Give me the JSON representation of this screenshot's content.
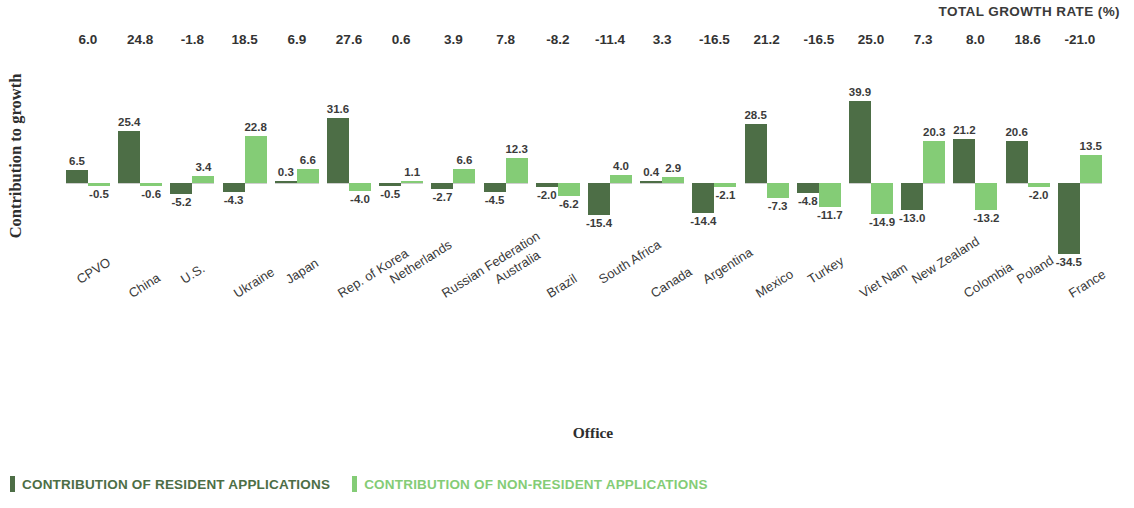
{
  "header": {
    "total_growth_rate_title": "TOTAL GROWTH RATE (%)"
  },
  "axes": {
    "y_title": "Contribution to growth",
    "x_title": "Office"
  },
  "legend": [
    {
      "label": "CONTRIBUTION OF RESIDENT APPLICATIONS",
      "color": "#4d6e46",
      "key": "resident"
    },
    {
      "label": "CONTRIBUTION OF NON-RESIDENT APPLICATIONS",
      "color": "#84cc76",
      "key": "non_resident"
    }
  ],
  "chart_data": {
    "type": "bar",
    "title": "",
    "subtitle": "",
    "xlabel": "Office",
    "ylabel": "Contribution to growth",
    "grid": false,
    "legend_position": "bottom-left",
    "ylim": [
      -36,
      42
    ],
    "categories": [
      "CPVO",
      "China",
      "U.S.",
      "Ukraine",
      "Japan",
      "Rep. of Korea",
      "Netherlands",
      "Russian Federation",
      "Australia",
      "Brazil",
      "South Africa",
      "Canada",
      "Argentina",
      "Mexico",
      "Turkey",
      "Viet Nam",
      "New Zealand",
      "Colombia",
      "Poland",
      "France"
    ],
    "series": [
      {
        "name": "CONTRIBUTION OF RESIDENT APPLICATIONS",
        "color": "#4d6e46",
        "values": [
          6.5,
          25.4,
          -5.2,
          -4.3,
          0.3,
          31.6,
          -0.5,
          -2.7,
          -4.5,
          -2.0,
          -15.4,
          0.4,
          -14.4,
          28.5,
          -4.8,
          39.9,
          -13.0,
          21.2,
          20.6,
          -34.5
        ]
      },
      {
        "name": "CONTRIBUTION OF NON-RESIDENT APPLICATIONS",
        "color": "#84cc76",
        "values": [
          -0.5,
          -0.6,
          3.4,
          22.8,
          6.6,
          -4.0,
          1.1,
          6.6,
          12.3,
          -6.2,
          4.0,
          2.9,
          -2.1,
          -7.3,
          -11.7,
          -14.9,
          20.3,
          -13.2,
          -2.0,
          13.5
        ]
      }
    ],
    "total_growth_rate": [
      6.0,
      24.8,
      -1.8,
      18.5,
      6.9,
      27.6,
      0.6,
      3.9,
      7.8,
      -8.2,
      -11.4,
      3.3,
      -16.5,
      21.2,
      -16.5,
      25.0,
      7.3,
      8.0,
      18.6,
      -21.0
    ]
  }
}
